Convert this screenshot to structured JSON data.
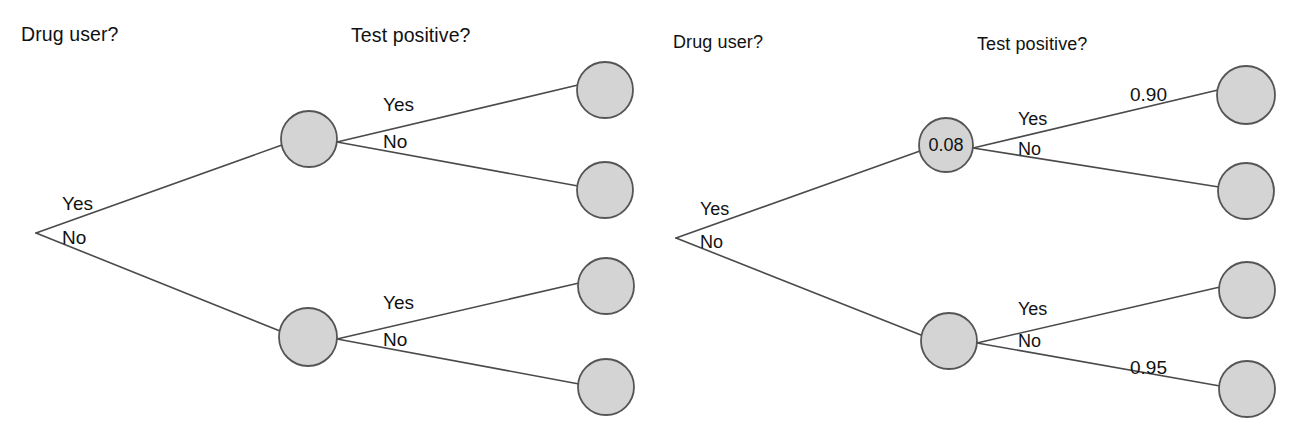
{
  "figure": {
    "background_color": "#ffffff",
    "node_fill_color": "#d4d4d4",
    "node_stroke_color": "#555555",
    "edge_color": "#4a4a4a",
    "text_color": "#111111"
  },
  "trees": [
    {
      "id": "left-tree",
      "name": "unlabeled-probability-tree",
      "headers": [
        {
          "name": "drug-user-header",
          "text": "Drug user?",
          "x": 21,
          "y": 25
        },
        {
          "name": "test-positive-header",
          "text": "Test positive?",
          "x": 351,
          "y": 26
        }
      ],
      "root": {
        "name": "root-vertex",
        "x": 36,
        "y": 233
      },
      "nodes": [
        {
          "name": "node-drug-user-yes",
          "x": 309,
          "y": 139,
          "r": 28,
          "value": ""
        },
        {
          "name": "node-drug-user-no",
          "x": 308,
          "y": 337,
          "r": 29,
          "value": ""
        },
        {
          "name": "leaf-yes-yes",
          "x": 605,
          "y": 90,
          "r": 28,
          "value": ""
        },
        {
          "name": "leaf-yes-no",
          "x": 605,
          "y": 190,
          "r": 28,
          "value": ""
        },
        {
          "name": "leaf-no-yes",
          "x": 606,
          "y": 286,
          "r": 28,
          "value": ""
        },
        {
          "name": "leaf-no-no",
          "x": 606,
          "y": 387,
          "r": 28,
          "value": ""
        }
      ],
      "edges": [
        {
          "name": "edge-root-to-yes",
          "x1": 36,
          "y1": 233,
          "x2": 282,
          "y2": 145
        },
        {
          "name": "edge-root-to-no",
          "x1": 36,
          "y1": 233,
          "x2": 280,
          "y2": 331
        },
        {
          "name": "edge-yes-to-yes",
          "x1": 337,
          "y1": 142,
          "x2": 578,
          "y2": 85
        },
        {
          "name": "edge-yes-to-no",
          "x1": 337,
          "y1": 142,
          "x2": 578,
          "y2": 186
        },
        {
          "name": "edge-no-to-yes",
          "x1": 337,
          "y1": 339,
          "x2": 579,
          "y2": 283
        },
        {
          "name": "edge-no-to-no",
          "x1": 337,
          "y1": 339,
          "x2": 579,
          "y2": 384
        }
      ],
      "branch_labels": [
        {
          "name": "label-root-yes",
          "text": "Yes",
          "x": 62,
          "y": 194
        },
        {
          "name": "label-root-no",
          "text": "No",
          "x": 62,
          "y": 228
        },
        {
          "name": "label-top-yes",
          "text": "Yes",
          "x": 383,
          "y": 95
        },
        {
          "name": "label-top-no",
          "text": "No",
          "x": 383,
          "y": 132
        },
        {
          "name": "label-bottom-yes",
          "text": "Yes",
          "x": 383,
          "y": 293
        },
        {
          "name": "label-bottom-no",
          "text": "No",
          "x": 383,
          "y": 330
        }
      ],
      "probability_labels": []
    },
    {
      "id": "right-tree",
      "name": "labeled-probability-tree",
      "headers": [
        {
          "name": "drug-user-header",
          "text": "Drug user?",
          "x": 673,
          "y": 33
        },
        {
          "name": "test-positive-header",
          "text": "Test positive?",
          "x": 977,
          "y": 35
        }
      ],
      "root": {
        "name": "root-vertex",
        "x": 676,
        "y": 238
      },
      "nodes": [
        {
          "name": "node-drug-user-yes",
          "x": 946,
          "y": 145,
          "r": 27,
          "value": "0.08"
        },
        {
          "name": "node-drug-user-no",
          "x": 949,
          "y": 341,
          "r": 28,
          "value": ""
        },
        {
          "name": "leaf-yes-yes",
          "x": 1246,
          "y": 95,
          "r": 29,
          "value": ""
        },
        {
          "name": "leaf-yes-no",
          "x": 1246,
          "y": 191,
          "r": 28,
          "value": ""
        },
        {
          "name": "leaf-no-yes",
          "x": 1247,
          "y": 290,
          "r": 28,
          "value": ""
        },
        {
          "name": "leaf-no-no",
          "x": 1247,
          "y": 389,
          "r": 28,
          "value": ""
        }
      ],
      "edges": [
        {
          "name": "edge-root-to-yes",
          "x1": 676,
          "y1": 238,
          "x2": 920,
          "y2": 151
        },
        {
          "name": "edge-root-to-no",
          "x1": 676,
          "y1": 238,
          "x2": 921,
          "y2": 335
        },
        {
          "name": "edge-yes-to-yes",
          "x1": 973,
          "y1": 148,
          "x2": 1218,
          "y2": 90
        },
        {
          "name": "edge-yes-to-no",
          "x1": 973,
          "y1": 148,
          "x2": 1219,
          "y2": 187
        },
        {
          "name": "edge-no-to-yes",
          "x1": 977,
          "y1": 343,
          "x2": 1220,
          "y2": 287
        },
        {
          "name": "edge-no-to-no",
          "x1": 977,
          "y1": 343,
          "x2": 1220,
          "y2": 386
        }
      ],
      "branch_labels": [
        {
          "name": "label-root-yes",
          "text": "Yes",
          "x": 700,
          "y": 200
        },
        {
          "name": "label-root-no",
          "text": "No",
          "x": 700,
          "y": 233
        },
        {
          "name": "label-top-yes",
          "text": "Yes",
          "x": 1018,
          "y": 110
        },
        {
          "name": "label-top-no",
          "text": "No",
          "x": 1018,
          "y": 140
        },
        {
          "name": "label-bottom-yes",
          "text": "Yes",
          "x": 1018,
          "y": 300
        },
        {
          "name": "label-bottom-no",
          "text": "No",
          "x": 1018,
          "y": 332
        }
      ],
      "probability_labels": [
        {
          "name": "prob-test-positive-given-user",
          "text": "0.90",
          "x": 1130,
          "y": 85
        },
        {
          "name": "prob-test-negative-given-nonuser",
          "text": "0.95",
          "x": 1130,
          "y": 358
        }
      ]
    }
  ],
  "chart_data": {
    "type": "diagram",
    "diagram_kind": "probability-tree",
    "title": "",
    "stage_labels": [
      "Drug user?",
      "Test positive?"
    ],
    "branch_outcomes": [
      "Yes",
      "No"
    ],
    "panels": [
      {
        "name": "unlabeled",
        "description": "Two-stage probability tree with unlabeled branches",
        "stage1": [
          {
            "outcome": "Yes",
            "probability": null
          },
          {
            "outcome": "No",
            "probability": null
          }
        ],
        "stage2_given_yes": [
          {
            "outcome": "Yes",
            "probability": null
          },
          {
            "outcome": "No",
            "probability": null
          }
        ],
        "stage2_given_no": [
          {
            "outcome": "Yes",
            "probability": null
          },
          {
            "outcome": "No",
            "probability": null
          }
        ],
        "node_values": [
          null,
          null,
          null,
          null,
          null,
          null
        ]
      },
      {
        "name": "labeled",
        "description": "Same tree with selected probabilities filled in",
        "stage1": [
          {
            "outcome": "Yes",
            "probability": 0.08
          },
          {
            "outcome": "No",
            "probability": null
          }
        ],
        "stage2_given_yes": [
          {
            "outcome": "Yes",
            "probability": 0.9
          },
          {
            "outcome": "No",
            "probability": null
          }
        ],
        "stage2_given_no": [
          {
            "outcome": "Yes",
            "probability": null
          },
          {
            "outcome": "No",
            "probability": 0.95
          }
        ],
        "node_values": [
          "0.08",
          null,
          null,
          null,
          null,
          null
        ]
      }
    ]
  }
}
